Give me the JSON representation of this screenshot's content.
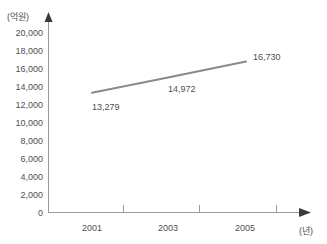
{
  "chart_data": {
    "type": "line",
    "title": "",
    "subtitle": "",
    "xlabel": "(년)",
    "ylabel": "(억원)",
    "categories": [
      "2001",
      "2003",
      "2005"
    ],
    "x": [
      2001,
      2003,
      2005
    ],
    "values": [
      13279,
      14972,
      16730
    ],
    "point_labels": [
      "13,279",
      "14,972",
      "16,730"
    ],
    "series": [
      {
        "name": "",
        "values": [
          13279,
          14972,
          16730
        ],
        "color": "#8a8a8a"
      }
    ],
    "ylim": [
      0,
      20000
    ],
    "ytick_values": [
      0,
      2000,
      4000,
      6000,
      8000,
      10000,
      12000,
      14000,
      16000,
      18000,
      20000
    ],
    "ytick_labels": [
      "0",
      "2,000",
      "4,000",
      "6,000",
      "8,000",
      "10,000",
      "12,000",
      "14,000",
      "16,000",
      "18,000",
      "20,000"
    ],
    "xtick_labels": [
      "2001",
      "2003",
      "2005"
    ],
    "grid": false,
    "legend": false,
    "legend_position": "none",
    "axis_arrows": true,
    "line_color": "#8a8a8a",
    "axis_color": "#9a9a9a",
    "text_color": "#4f4f4f",
    "background": "#ffffff"
  }
}
